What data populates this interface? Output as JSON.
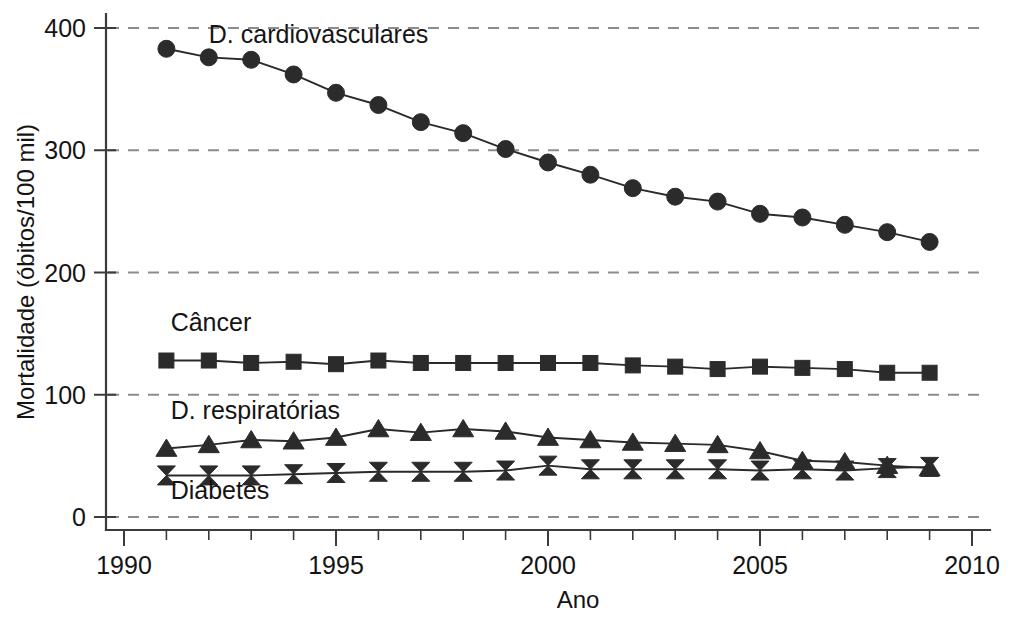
{
  "chart_data": {
    "type": "line",
    "title": "",
    "xlabel": "Ano",
    "ylabel": "Mortalidade (óbitos/100 mil)",
    "xlim": [
      1990,
      2010
    ],
    "ylim": [
      0,
      400
    ],
    "xticks": [
      1990,
      1995,
      2000,
      2005,
      2010
    ],
    "xtick_labels": [
      "1990",
      "1995",
      "2000",
      "2005",
      "2010"
    ],
    "yticks": [
      0,
      100,
      200,
      300,
      400
    ],
    "ytick_labels": [
      "0",
      "100",
      "200",
      "300",
      "400"
    ],
    "x_minor_tick_step": 1,
    "grid": "horizontal-dashed",
    "legend_position": "inline-labels",
    "x": [
      1991,
      1992,
      1993,
      1994,
      1995,
      1996,
      1997,
      1998,
      1999,
      2000,
      2001,
      2002,
      2003,
      2004,
      2005,
      2006,
      2007,
      2008,
      2009
    ],
    "series": [
      {
        "name": "D. cardiovasculares",
        "marker": "circle",
        "label_x": 1992.0,
        "label_y": 388,
        "values": [
          383,
          376,
          374,
          362,
          347,
          337,
          323,
          314,
          301,
          290,
          280,
          269,
          262,
          258,
          248,
          245,
          239,
          233,
          225
        ]
      },
      {
        "name": "Câncer",
        "marker": "square",
        "label_x": 1991.1,
        "label_y": 152,
        "values": [
          128,
          128,
          126,
          127,
          125,
          128,
          126,
          126,
          126,
          126,
          126,
          124,
          123,
          121,
          123,
          122,
          121,
          118,
          118
        ]
      },
      {
        "name": "D. respiratórias",
        "marker": "triangle",
        "label_x": 1991.1,
        "label_y": 80,
        "values": [
          56,
          59,
          63,
          62,
          65,
          72,
          69,
          72,
          70,
          65,
          63,
          61,
          60,
          59,
          54,
          46,
          45,
          42,
          40
        ]
      },
      {
        "name": "Diabetes",
        "marker": "bowtie",
        "label_x": 1991.1,
        "label_y": 15,
        "values": [
          34,
          34,
          34,
          35,
          36,
          37,
          37,
          37,
          38,
          42,
          39,
          39,
          39,
          39,
          38,
          39,
          38,
          40,
          41
        ]
      }
    ]
  },
  "colors": {
    "line": "#2a2a2a",
    "marker": "#2b2b2b",
    "grid": "#8c8c8c",
    "axis": "#3b3b3b",
    "text": "#141414",
    "background": "#ffffff"
  }
}
